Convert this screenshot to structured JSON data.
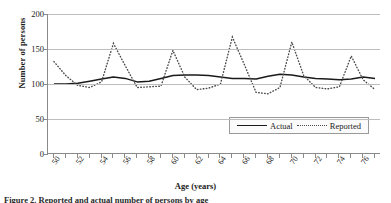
{
  "chart_data": {
    "type": "line",
    "title": "",
    "xlabel": "Age (years)",
    "ylabel": "Number of persons",
    "xlim": [
      49.5,
      77.5
    ],
    "ylim": [
      0,
      200
    ],
    "yticks": [
      0,
      50,
      100,
      150,
      200
    ],
    "ytick_labels": [
      "0",
      "50",
      "100",
      "150",
      "200"
    ],
    "xticks": [
      50,
      51,
      52,
      53,
      54,
      55,
      56,
      57,
      58,
      59,
      60,
      61,
      62,
      63,
      64,
      65,
      66,
      67,
      68,
      69,
      70,
      71,
      72,
      73,
      74,
      75,
      76,
      77
    ],
    "xtick_labels": [
      "50",
      "52",
      "54",
      "56",
      "58",
      "60",
      "62",
      "64",
      "66",
      "68",
      "70",
      "72",
      "74",
      "76"
    ],
    "xtick_label_values": [
      50,
      52,
      54,
      56,
      58,
      60,
      62,
      64,
      66,
      68,
      70,
      72,
      74,
      76
    ],
    "grid": "horizontal",
    "legend_position": "inside-lower-right",
    "x": [
      50,
      51,
      52,
      53,
      54,
      55,
      56,
      57,
      58,
      59,
      60,
      61,
      62,
      63,
      64,
      65,
      66,
      67,
      68,
      69,
      70,
      71,
      72,
      73,
      74,
      75,
      76,
      77
    ],
    "series": [
      {
        "name": "Actual",
        "style": "solid",
        "color": "#1a1a1a",
        "values": [
          100,
          100,
          101,
          104,
          107,
          110,
          108,
          103,
          104,
          108,
          112,
          113,
          113,
          112,
          110,
          108,
          108,
          107,
          111,
          114,
          113,
          110,
          108,
          107,
          106,
          107,
          110,
          108
        ]
      },
      {
        "name": "Reported",
        "style": "dotted",
        "color": "#4a4a4a",
        "values": [
          132,
          112,
          98,
          95,
          103,
          158,
          126,
          95,
          96,
          97,
          148,
          110,
          92,
          94,
          100,
          167,
          128,
          88,
          86,
          95,
          160,
          112,
          95,
          93,
          96,
          140,
          106,
          92
        ]
      }
    ]
  },
  "legend": {
    "items": [
      {
        "label": "Actual",
        "style": "solid"
      },
      {
        "label": "Reported",
        "style": "dotted"
      }
    ]
  },
  "caption": {
    "text": "Figure 2. Reported and actual number of persons by age"
  }
}
